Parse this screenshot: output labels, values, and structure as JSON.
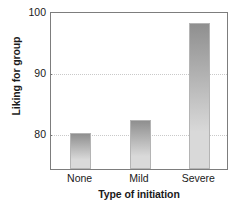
{
  "chart_data": {
    "type": "bar",
    "title": "",
    "categories": [
      "None",
      "Mild",
      "Severe"
    ],
    "values": [
      80,
      82,
      98
    ],
    "series": [
      {
        "name": "Liking for group",
        "values": [
          80,
          82,
          98
        ]
      }
    ],
    "xlabel": "Type of initiation",
    "ylabel": "Liking for group",
    "ylim": [
      74,
      100
    ],
    "yticks": [
      80,
      90,
      100
    ],
    "ytick_labels": [
      "80",
      "90",
      "100"
    ],
    "grid": "horizontal-dotted",
    "legend": "none",
    "bar_fill_top": "#8f8f8f",
    "bar_fill_bottom": "#d9d9d9",
    "bar_edge_color": "#b4b4b4",
    "axis_color": "#7d7d7d",
    "gridline_color": "#c9c9c9",
    "text_color": "#1a1a1a",
    "background": "#ffffff"
  }
}
